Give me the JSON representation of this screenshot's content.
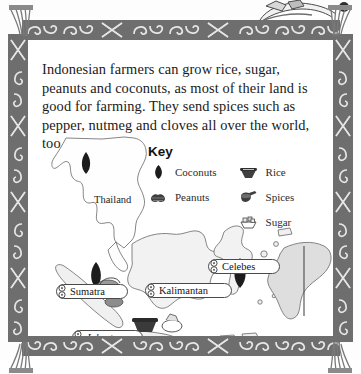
{
  "page": {
    "background_color": "#ffffff",
    "frame_color": "#6e6e6e",
    "ink_color": "#1a1a1a"
  },
  "body_text": {
    "paragraph": "Indonesian farmers can grow rice, sugar, peanuts and coconuts, as most of their land is good for farming. They send spices such as pepper, nutmeg and cloves all over the world, too."
  },
  "key": {
    "title": "Key",
    "columns": [
      {
        "items": [
          {
            "icon": "coconut-icon",
            "label": "Coconuts",
            "color": "#202020"
          },
          {
            "icon": "peanut-icon",
            "label": "Peanuts",
            "color": "#3a3a3a"
          }
        ]
      },
      {
        "items": [
          {
            "icon": "rice-bowl-icon",
            "label": "Rice",
            "color": "#3a3a3a"
          },
          {
            "icon": "spices-mortar-icon",
            "label": "Spices",
            "color": "#3a3a3a"
          },
          {
            "icon": "sugar-bowl-icon",
            "label": "Sugar",
            "color": "#6b6b6b"
          }
        ]
      }
    ]
  },
  "map": {
    "plain_labels": [
      {
        "name": "Thailand",
        "text": "Thailand",
        "x": 66,
        "y": 152,
        "style": "plain"
      }
    ],
    "scroll_labels": [
      {
        "name": "Sumatra",
        "text": "Sumatra",
        "x": 28,
        "y": 244,
        "width": 72,
        "italic": false
      },
      {
        "name": "Kalimantan",
        "text": "Kalimantan",
        "x": 117,
        "y": 243,
        "width": 87,
        "italic": false
      },
      {
        "name": "Celebes",
        "text": "Celebes",
        "x": 180,
        "y": 219,
        "width": 72,
        "italic": false
      },
      {
        "name": "Jakarta",
        "text": "Jakarta",
        "x": 44,
        "y": 290,
        "width": 71,
        "italic": true
      },
      {
        "name": "Java",
        "text": "Java",
        "x": 103,
        "y": 313,
        "width": 48,
        "italic": false
      },
      {
        "name": "Bali",
        "text": "Bali",
        "x": 148,
        "y": 313,
        "width": 44,
        "italic": false
      }
    ]
  }
}
